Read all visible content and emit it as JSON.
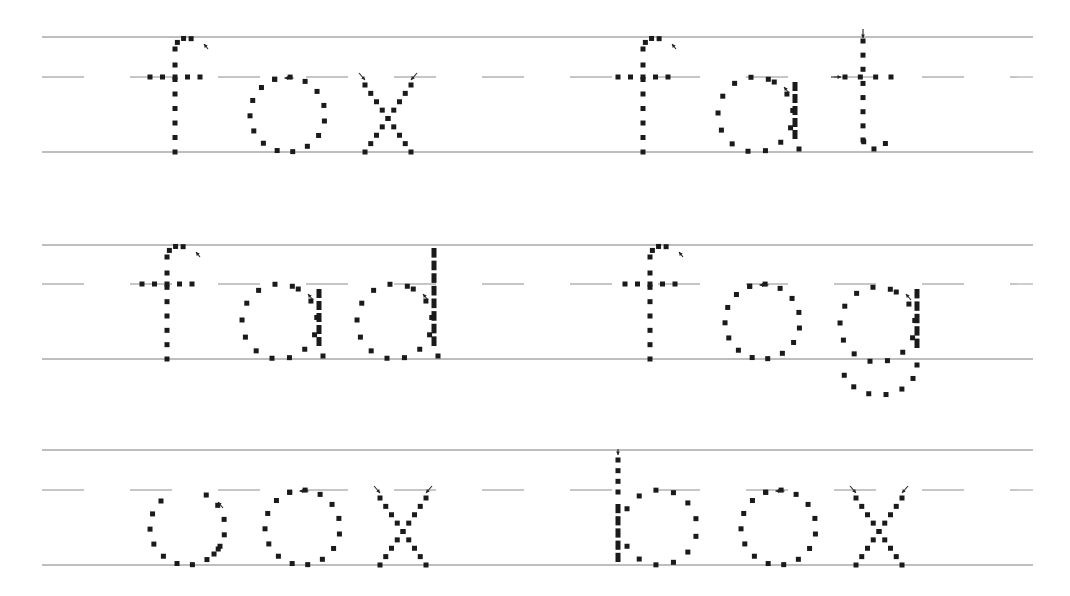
{
  "worksheet": {
    "title": "Letter f tracing practice",
    "colors": {
      "guide_line": "#a9a9a9",
      "dash_line": "#b4b4b4",
      "dot": "#1a1a1a"
    },
    "rows": [
      {
        "top": 37,
        "mid": 77,
        "base": 152,
        "words": [
          {
            "text": "fox",
            "x": 150
          },
          {
            "text": "fat",
            "x": 618
          }
        ]
      },
      {
        "top": 245,
        "mid": 284,
        "base": 359,
        "words": [
          {
            "text": "fad",
            "x": 142
          },
          {
            "text": "fog",
            "x": 625
          }
        ]
      },
      {
        "top": 450,
        "mid": 490,
        "base": 565,
        "words": [
          {
            "text": "cox",
            "x": 150
          },
          {
            "text": "box",
            "x": 618
          }
        ]
      }
    ],
    "line_x_start": 42,
    "line_x_end": 1033
  }
}
